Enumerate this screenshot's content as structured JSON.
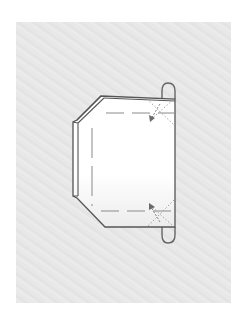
{
  "diagram": {
    "kind": "origami-fold-step",
    "colors": {
      "background": "#ffffff",
      "texture": "#e8e8e8",
      "paper": "#ffffff",
      "outline": "#555555",
      "dash": "#888888",
      "arrow": "#777777"
    },
    "elements": [
      {
        "name": "paper-shape",
        "type": "outline"
      },
      {
        "name": "left-flap",
        "type": "double-edge"
      },
      {
        "name": "top-loop",
        "type": "loop"
      },
      {
        "name": "bottom-loop",
        "type": "loop"
      },
      {
        "name": "fold-guide-top",
        "type": "dashed-line"
      },
      {
        "name": "fold-guide-left",
        "type": "dashed-line"
      },
      {
        "name": "fold-guide-bottom",
        "type": "dashed-line"
      },
      {
        "name": "crease-top-right",
        "type": "dotted-cross"
      },
      {
        "name": "crease-bottom-right",
        "type": "dotted-cross"
      },
      {
        "name": "fold-arrow-top",
        "type": "arrow",
        "direction": "down-left"
      },
      {
        "name": "fold-arrow-bottom",
        "type": "arrow",
        "direction": "up-left"
      }
    ]
  }
}
